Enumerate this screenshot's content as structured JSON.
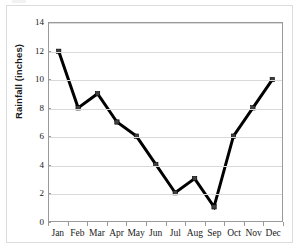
{
  "chart_data": {
    "type": "line",
    "title": "",
    "subtitle": "",
    "xlabel": "",
    "ylabel": "Rainfall (inches)",
    "categories": [
      "Jan",
      "Feb",
      "Mar",
      "Apr",
      "May",
      "Jun",
      "Jul",
      "Aug",
      "Sep",
      "Oct",
      "Nov",
      "Dec"
    ],
    "values": [
      12,
      8,
      9,
      7,
      6,
      4,
      2,
      3,
      1,
      6,
      8,
      10
    ],
    "series": [
      {
        "name": "Rainfall",
        "values": [
          12,
          8,
          9,
          7,
          6,
          4,
          2,
          3,
          1,
          6,
          8,
          10
        ]
      }
    ],
    "ylim": [
      0,
      14
    ],
    "ytick_step": 2,
    "ytick_labels": [
      "0",
      "2",
      "4",
      "6",
      "8",
      "10",
      "12",
      "14"
    ],
    "grid": "horizontal",
    "legend": "none",
    "line_color": "#000000",
    "marker_color": "#3f3f3f",
    "grid_color": "#d9d9d9",
    "axis_color": "#9a9a9a",
    "text_color": "#1a1a1a",
    "marker": "square"
  }
}
